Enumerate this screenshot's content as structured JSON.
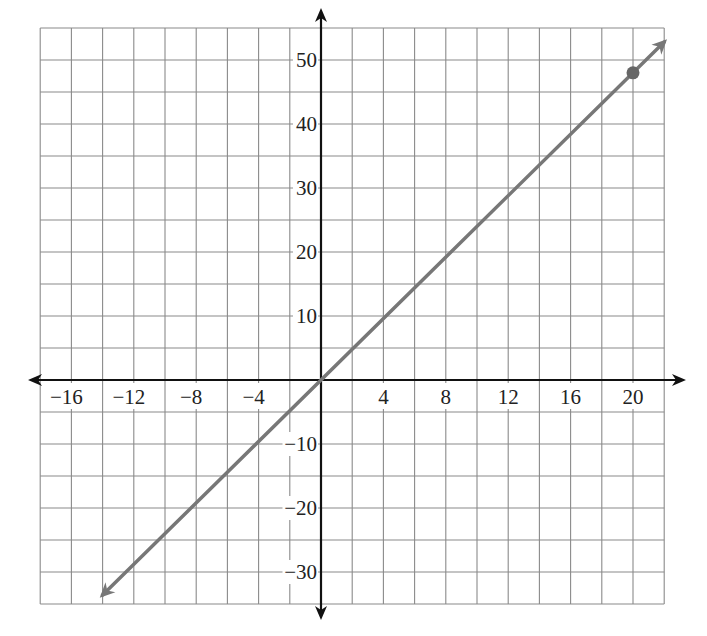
{
  "chart_data": {
    "type": "line",
    "title": "",
    "xlabel": "",
    "ylabel": "",
    "xlim": [
      -18,
      22
    ],
    "ylim": [
      -35,
      55
    ],
    "grid": true,
    "grid_x_step": 2,
    "grid_y_step": 5,
    "x_ticks": [
      -16,
      -12,
      -8,
      -4,
      4,
      8,
      12,
      16,
      20
    ],
    "x_tick_labels": [
      "−16",
      "−12",
      "−8",
      "−4",
      "4",
      "8",
      "12",
      "16",
      "20"
    ],
    "y_ticks": [
      50,
      40,
      30,
      20,
      10,
      -10,
      -20,
      -30
    ],
    "y_tick_labels": [
      "50",
      "40",
      "30",
      "20",
      "10",
      "−10",
      "−20",
      "−30"
    ],
    "series": [
      {
        "name": "line",
        "equation": "y = 2.4x",
        "slope": 2.4,
        "intercept": 0,
        "x": [
          -14,
          22
        ],
        "y": [
          -33.6,
          52.8
        ],
        "color": "#777777",
        "arrows": "both"
      }
    ],
    "points": [
      {
        "x": 20,
        "y": 48,
        "color": "#666666"
      }
    ],
    "legend": null
  },
  "colors": {
    "grid": "#8a8a8a",
    "axis": "#111111",
    "line": "#777777",
    "point": "#666666"
  }
}
